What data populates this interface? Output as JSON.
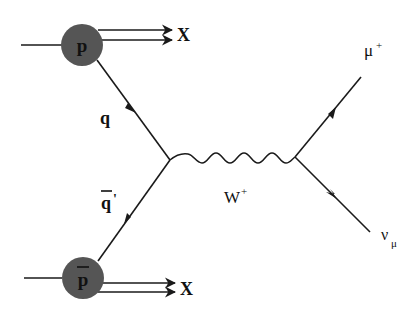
{
  "diagram": {
    "type": "feynman",
    "process": "p pbar -> W+ -> mu+ nu_mu",
    "colors": {
      "line": "#1a1a1a",
      "hadron_blob": "#555555",
      "text": "#111111"
    },
    "labels": {
      "proton": "p",
      "antiproton": "p",
      "x_top": "X",
      "x_bottom": "X",
      "quark": "q",
      "antiquark": "q",
      "antiquark_prime": "'",
      "boson": "W",
      "boson_charge": "+",
      "muon": "μ",
      "muon_charge": "+",
      "neutrino": "ν",
      "neutrino_sub": "μ"
    }
  }
}
